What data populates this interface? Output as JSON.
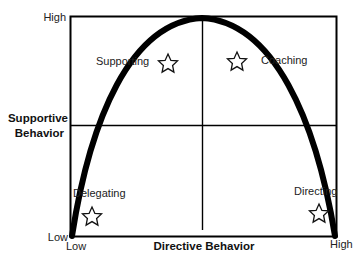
{
  "diagram": {
    "x_axis": {
      "title": "Directive Behavior",
      "low": "Low",
      "high": "High"
    },
    "y_axis": {
      "title_line1": "Supportive",
      "title_line2": "Behavior",
      "low": "Low",
      "high": "High"
    },
    "quadrants": [
      {
        "label": "Supporting",
        "icon": "star-icon"
      },
      {
        "label": "Coaching",
        "icon": "star-icon"
      },
      {
        "label": "Delegating",
        "icon": "star-icon"
      },
      {
        "label": "Directing",
        "icon": "star-icon"
      }
    ],
    "colors": {
      "line": "#000000",
      "background": "#ffffff",
      "text": "#222222"
    }
  }
}
